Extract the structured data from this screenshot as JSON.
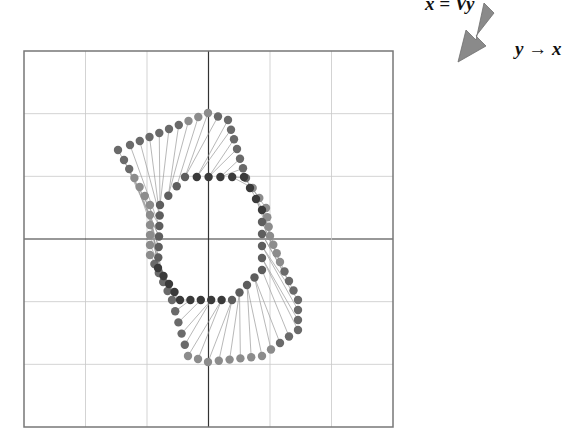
{
  "labels": {
    "equation": "x = Vy",
    "mapping": "y → x"
  },
  "arrow": {
    "icon": "arrow-down-left-icon",
    "color": "#8a8a8a",
    "from": [
      490,
      10
    ],
    "to": [
      458,
      62
    ]
  },
  "plot": {
    "box": {
      "left": 24,
      "top": 51,
      "right": 393,
      "bottom": 427
    },
    "grid_divisions": 6,
    "axis_center": [
      208,
      239
    ],
    "grid_color": "#c8c8c8",
    "axis_color": "#333333",
    "point_color_dark": "#3a3a3a",
    "point_color_light": "#8c8c8c",
    "line_color": "#9a9a9a"
  },
  "chart_data": {
    "type": "scatter",
    "title": "",
    "xlabel": "",
    "ylabel": "",
    "grid": true,
    "annotations": [
      "x = Vy",
      "y → x"
    ],
    "series": [
      {
        "name": "outer-shape (y)",
        "description": "twisted six-pointed closed polygon of points"
      },
      {
        "name": "inner-ring (x)",
        "description": "hexagonal ring of points near origin"
      }
    ]
  }
}
